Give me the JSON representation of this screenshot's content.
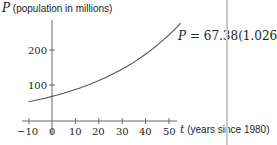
{
  "chart_data": {
    "type": "line",
    "title": "",
    "ylabel": "P (population in millions)",
    "xlabel": "t (years since 1980)",
    "ylabel_var": "P",
    "ylabel_text": "(population in millions)",
    "xlabel_var": "t",
    "xlabel_text": "(years since 1980)",
    "equation": {
      "lhs": "P",
      "rhs": "= 67.38(1.026)",
      "exponent": "t",
      "a": 67.38,
      "b": 1.026
    },
    "xlim": [
      -10,
      55
    ],
    "ylim": [
      0,
      280
    ],
    "x_ticks": [
      -10,
      0,
      10,
      20,
      30,
      40,
      50
    ],
    "y_ticks": [
      100,
      200
    ],
    "grid": false,
    "series": [
      {
        "name": "P = 67.38(1.026)^t",
        "x": [
          -10,
          0,
          10,
          20,
          30,
          40,
          50,
          55
        ],
        "values": [
          52.1,
          67.4,
          87.1,
          112.6,
          145.6,
          188.3,
          243.5,
          276.8
        ]
      }
    ]
  },
  "caption": "Figure 1.5: Population of Mexico (estimated), exponential growth"
}
